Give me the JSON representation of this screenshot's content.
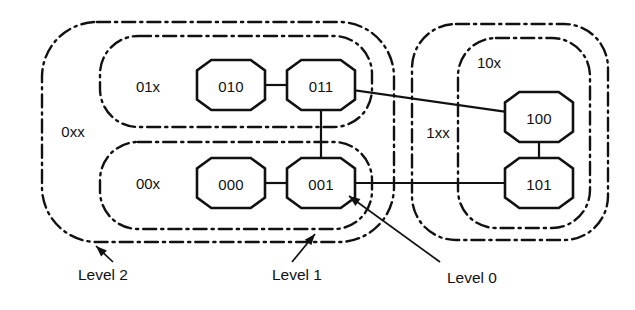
{
  "diagram": {
    "nodes": [
      {
        "id": "010",
        "label": "010",
        "cx": 231,
        "cy": 85
      },
      {
        "id": "011",
        "label": "011",
        "cx": 321,
        "cy": 85
      },
      {
        "id": "000",
        "label": "000",
        "cx": 231,
        "cy": 183
      },
      {
        "id": "001",
        "label": "001",
        "cx": 321,
        "cy": 183
      },
      {
        "id": "100",
        "label": "100",
        "cx": 539,
        "cy": 117
      },
      {
        "id": "101",
        "label": "101",
        "cx": 539,
        "cy": 183
      }
    ],
    "edges": [
      {
        "from": "010",
        "to": "011"
      },
      {
        "from": "011",
        "to": "001"
      },
      {
        "from": "000",
        "to": "001"
      },
      {
        "from": "011",
        "to": "100"
      },
      {
        "from": "001",
        "to": "101"
      },
      {
        "from": "100",
        "to": "101"
      }
    ],
    "regions": [
      {
        "id": "0xx",
        "label": "0xx",
        "label_x": 73,
        "label_y": 131,
        "x": 42,
        "y": 22,
        "w": 352,
        "h": 220,
        "r": 55
      },
      {
        "id": "01x",
        "label": "01x",
        "label_x": 148,
        "label_y": 86,
        "x": 100,
        "y": 36,
        "w": 272,
        "h": 91,
        "r": 38
      },
      {
        "id": "00x",
        "label": "00x",
        "label_x": 148,
        "label_y": 183,
        "x": 100,
        "y": 142,
        "w": 272,
        "h": 87,
        "r": 38
      },
      {
        "id": "1xx",
        "label": "1xx",
        "label_x": 438,
        "label_y": 132,
        "x": 412,
        "y": 24,
        "w": 196,
        "h": 216,
        "r": 44
      },
      {
        "id": "10x",
        "label": "10x",
        "label_x": 489,
        "label_y": 62,
        "x": 458,
        "y": 38,
        "w": 132,
        "h": 190,
        "r": 38
      }
    ],
    "annotations": [
      {
        "id": "level-2",
        "label": "Level 2",
        "text_x": 78,
        "text_y": 274,
        "line": [
          [
            113,
            262
          ],
          [
            96,
            246
          ]
        ],
        "head": [
          96,
          246
        ],
        "head_rot": -136
      },
      {
        "id": "level-1",
        "label": "Level 1",
        "text_x": 272,
        "text_y": 274,
        "line": [
          [
            292,
            262
          ],
          [
            315,
            234
          ]
        ],
        "head": [
          315,
          234
        ],
        "head_rot": -50
      },
      {
        "id": "level-0",
        "label": "Level 0",
        "text_x": 447,
        "text_y": 277,
        "line": [
          [
            440,
            262
          ],
          [
            349,
            196
          ]
        ],
        "head": [
          349,
          196
        ],
        "head_rot": -144
      }
    ]
  },
  "colors": {
    "ink": "#111111",
    "paper": "#ffffff"
  }
}
